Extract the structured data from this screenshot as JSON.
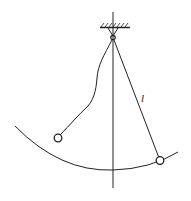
{
  "diagram": {
    "title": "",
    "labels": {
      "length": "l"
    },
    "colors": {
      "stroke": "#222222",
      "background": "#ffffff"
    }
  }
}
